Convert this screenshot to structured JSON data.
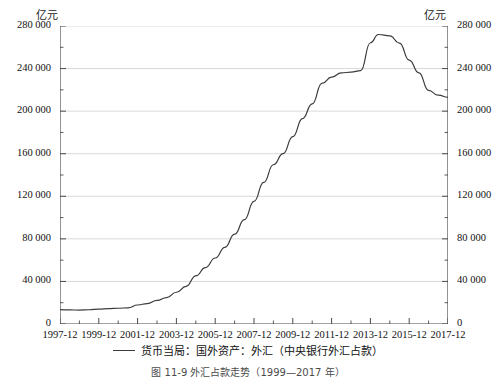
{
  "chart_data": {
    "type": "line",
    "title": "",
    "caption": "图 11-9  外汇占款走势（1999—2017 年）",
    "xlabel": "",
    "ylabel": "亿元",
    "y_unit_left": "亿元",
    "y_unit_right": "亿元",
    "grid": true,
    "legend_position": "bottom",
    "ylim": [
      0,
      280000
    ],
    "ytick_labels": [
      "0",
      "40 000",
      "80 000",
      "120 000",
      "160 000",
      "200 000",
      "240 000",
      "280 000"
    ],
    "ytick_values": [
      0,
      40000,
      80000,
      120000,
      160000,
      200000,
      240000,
      280000
    ],
    "yminor_step": 20000,
    "xtick_labels": [
      "1997-12",
      "1999-12",
      "2001-12",
      "2003-12",
      "2005-12",
      "2007-12",
      "2009-12",
      "2011-12",
      "2013-12",
      "2015-12",
      "2017-12"
    ],
    "xlim": [
      "1997-12",
      "2017-12"
    ],
    "xminor_step_years": 1,
    "series": [
      {
        "name": "货币当局：国外资产：外汇（中央银行外汇占款）",
        "color": "#3c3c3c",
        "x": [
          "1997-12",
          "1998-06",
          "1998-12",
          "1999-06",
          "1999-12",
          "2000-06",
          "2000-12",
          "2001-06",
          "2001-12",
          "2002-06",
          "2002-12",
          "2003-06",
          "2003-12",
          "2004-06",
          "2004-12",
          "2005-06",
          "2005-12",
          "2006-06",
          "2006-12",
          "2007-06",
          "2007-12",
          "2008-06",
          "2008-12",
          "2009-06",
          "2009-12",
          "2010-06",
          "2010-12",
          "2011-06",
          "2011-12",
          "2012-06",
          "2012-12",
          "2013-06",
          "2013-12",
          "2014-05",
          "2014-12",
          "2015-06",
          "2015-12",
          "2016-06",
          "2016-12",
          "2017-06",
          "2017-12"
        ],
        "y": [
          13467,
          13200,
          13100,
          13400,
          14061,
          14500,
          14815,
          15200,
          17856,
          19200,
          22107,
          24800,
          29842,
          35400,
          45200,
          53000,
          62000,
          72000,
          84361,
          98000,
          115169,
          133000,
          149624,
          160000,
          176000,
          193000,
          206767,
          226000,
          232000,
          236000,
          236670,
          238000,
          264270,
          272000,
          270700,
          264000,
          248000,
          236000,
          219430,
          215000,
          213000
        ]
      }
    ]
  },
  "axes": {
    "left_unit": "亿元",
    "right_unit": "亿元"
  },
  "legend": {
    "entries": [
      {
        "label": "货币当局：国外资产：外汇（中央银行外汇占款）",
        "color": "#3c3c3c"
      }
    ]
  },
  "caption": {
    "text": "图 11-9  外汇占款走势（1999—2017 年）"
  }
}
